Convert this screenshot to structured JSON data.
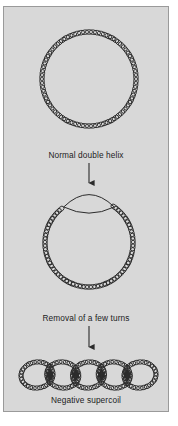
{
  "figure": {
    "background_color": "#d8d8d8",
    "border_color": "#9a9a9a",
    "ink_color": "#2b2b2b",
    "text_color": "#1c1c1c",
    "stages": [
      {
        "id": "stage-normal-helix",
        "caption": "Normal double helix",
        "shape": "circle",
        "description": "closed circular DNA drawn as a continuous beaded double helix",
        "center_x": 85,
        "center_y": 72,
        "radius": 47,
        "bead_count": 74,
        "unwound": false
      },
      {
        "id": "stage-unwound-helix",
        "caption": "Removal of a few turns",
        "shape": "circle-with-bubble",
        "description": "same circle with an unwound lens-shaped bubble at the top where strands separate",
        "center_x": 85,
        "center_y": 236,
        "radius": 44,
        "bead_count": 62,
        "unwound": true,
        "bubble_start_deg": -125,
        "bubble_end_deg": -55,
        "bubble_bulge": 13
      },
      {
        "id": "stage-negative-supercoil",
        "caption": "Negative supercoil",
        "shape": "plectoneme",
        "description": "horizontal chain of interwound loops forming a negative supercoil",
        "loop_count": 5,
        "left_x": 17,
        "right_x": 152,
        "center_y": 368,
        "loop_radius_x": 16,
        "loop_radius_y": 13
      }
    ],
    "arrows": [
      {
        "id": "arrow-1",
        "from_stage": "stage-normal-helix",
        "to_stage": "stage-unwound-helix",
        "direction": "down",
        "x": 85,
        "y_start": 156,
        "y_end": 176
      },
      {
        "id": "arrow-2",
        "from_stage": "stage-unwound-helix",
        "to_stage": "stage-negative-supercoil",
        "direction": "down",
        "x": 85,
        "y_start": 319,
        "y_end": 340
      }
    ]
  }
}
